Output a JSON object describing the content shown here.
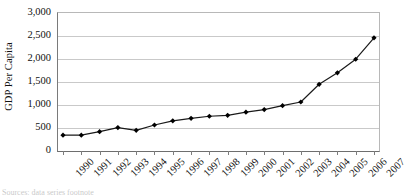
{
  "chart_data": {
    "type": "line",
    "title": "",
    "xlabel": "",
    "ylabel": "GDP Per Capita",
    "ylim": [
      0,
      3000
    ],
    "ytick_labels": [
      "3,000",
      "2,500",
      "2,000",
      "1,500",
      "1,000",
      "500",
      "0"
    ],
    "ytick_values": [
      3000,
      2500,
      2000,
      1500,
      1000,
      500,
      0
    ],
    "grid": true,
    "legend": "none",
    "marker": "diamond",
    "line_color": "#1a1a1a",
    "marker_color": "#000000",
    "grid_color": "#c9c9c9",
    "categories": [
      "1990",
      "1991",
      "1992",
      "1993",
      "1994",
      "1995",
      "1996",
      "1997",
      "1998",
      "1999",
      "2000",
      "2001",
      "2002",
      "2003",
      "2004",
      "2005",
      "2006",
      "2007"
    ],
    "values": [
      345,
      345,
      420,
      510,
      450,
      565,
      655,
      710,
      755,
      775,
      845,
      900,
      985,
      1065,
      1450,
      1700,
      1995,
      2460
    ]
  },
  "scan_artifact": {
    "text": "Sources: data series footnote"
  }
}
